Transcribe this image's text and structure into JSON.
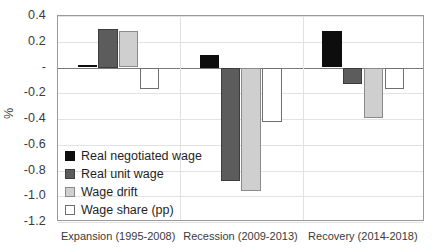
{
  "chart_data": {
    "type": "bar",
    "title": "",
    "xlabel": "",
    "ylabel": "%",
    "ylim": [
      -1.2,
      0.4
    ],
    "ytick_labels": [
      "0.4",
      "0.2",
      "-",
      "-0.2",
      "-0.4",
      "-0.6",
      "-0.8",
      "-1.0",
      "-1.2"
    ],
    "ytick_values": [
      0.4,
      0.2,
      0.0,
      -0.2,
      -0.4,
      -0.6,
      -0.8,
      -1.0,
      -1.2
    ],
    "grid": true,
    "legend_position": "inside-lower-left",
    "categories": [
      "Expansion (1995-2008)",
      "Recession (2009-2013)",
      "Recovery (2014-2018)"
    ],
    "series": [
      {
        "name": "Real negotiated wage",
        "color": "#0d0d0d",
        "values": [
          0.02,
          0.1,
          0.28
        ]
      },
      {
        "name": "Real unit wage",
        "color": "#5c5c5c",
        "values": [
          0.3,
          -0.88,
          -0.13
        ]
      },
      {
        "name": "Wage drift",
        "color": "#cfcfcf",
        "values": [
          0.28,
          -0.96,
          -0.39
        ]
      },
      {
        "name": "Wage share (pp)",
        "color": "#ffffff",
        "values": [
          -0.17,
          -0.42,
          -0.17
        ]
      }
    ]
  }
}
